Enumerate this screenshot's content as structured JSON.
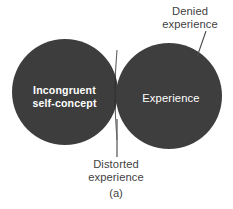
{
  "figure": {
    "caption": "(a)",
    "background_color": "#ffffff",
    "circle_fill_color": "#3d3d3d",
    "circle_text_color": "#ffffff",
    "outside_text_color": "#3f3f3f",
    "leader_line_color": "#4a4a4a"
  },
  "shapes": {
    "left_circle": {
      "name": "incongruent-self-concept-circle",
      "label": "Incongruent\nself-concept",
      "label_line_1": "Incongruent",
      "label_line_2": "self-concept",
      "cx": 65,
      "cy": 92,
      "r": 53,
      "fill": "#3d3d3d"
    },
    "right_circle": {
      "name": "experience-circle",
      "label": "Experience",
      "cx": 169,
      "cy": 96,
      "r": 53,
      "fill": "#3e3e3e"
    }
  },
  "annotations": [
    {
      "id": "denied",
      "line_1": "Denied",
      "line_2": "experience",
      "text": "Denied experience",
      "leader": {
        "x1": 206,
        "y1": 31,
        "x2": 197,
        "y2": 57
      }
    },
    {
      "id": "distorted",
      "line_1": "Distorted",
      "line_2": "experience",
      "text": "Distorted experience",
      "leader": {
        "x1": 117,
        "y1": 119,
        "x2": 117,
        "y2": 157
      }
    }
  ]
}
